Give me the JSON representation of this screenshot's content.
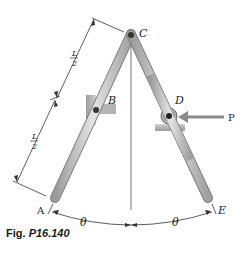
{
  "figure": {
    "caption_prefix": "Fig.",
    "caption_number": "P16.140"
  },
  "labels": {
    "A": "A",
    "B": "B",
    "C": "C",
    "D": "D",
    "E": "E",
    "P": "P",
    "theta_left": "θ",
    "theta_right": "θ",
    "half_length_num": "L",
    "half_length_den": "2"
  },
  "colors": {
    "bar_fill": "#c9c9c9",
    "bar_stroke": "#7a7a7a",
    "support_fill": "#a8a8a8",
    "arrow": "#8a8a8a",
    "line": "#333333"
  }
}
